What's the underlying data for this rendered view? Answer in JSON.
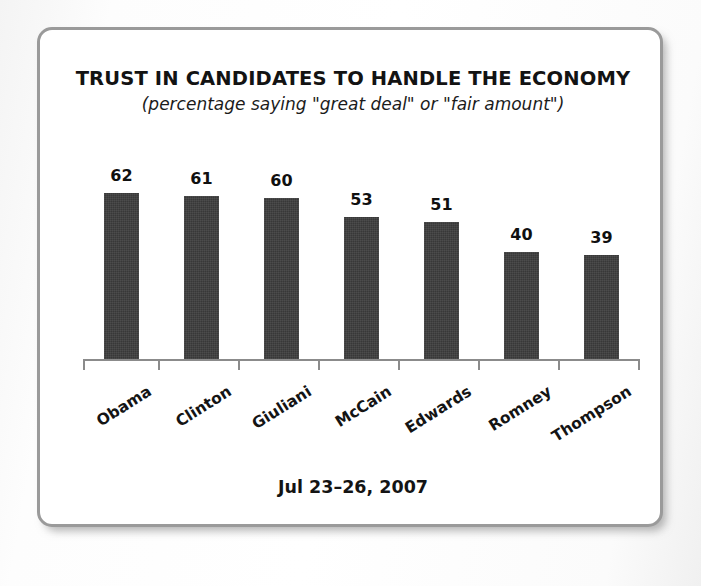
{
  "frame": {
    "border_color": "#9a9a9a",
    "background": "#ffffff"
  },
  "header": {
    "title": "TRUST IN CANDIDATES TO HANDLE THE ECONOMY",
    "subtitle": "(percentage saying \"great deal\" or \"fair amount\")"
  },
  "footer": {
    "date": "Jul 23–26, 2007"
  },
  "chart_data": {
    "type": "bar",
    "title": "TRUST IN CANDIDATES TO HANDLE THE ECONOMY",
    "subtitle": "(percentage saying \"great deal\" or \"fair amount\")",
    "xlabel": "",
    "ylabel": "",
    "ylim": [
      0,
      70
    ],
    "grid": false,
    "legend": "none",
    "bar_color": "#383838",
    "axis_color": "#8b8b8b",
    "value_label_position": "above",
    "xtick_label_rotation": -32,
    "categories": [
      "Obama",
      "Clinton",
      "Giuliani",
      "McCain",
      "Edwards",
      "Romney",
      "Thompson"
    ],
    "values": [
      62,
      61,
      60,
      53,
      51,
      40,
      39
    ],
    "points": [
      {
        "category": "Obama",
        "value": 62
      },
      {
        "category": "Clinton",
        "value": 61
      },
      {
        "category": "Giuliani",
        "value": 60
      },
      {
        "category": "McCain",
        "value": 53
      },
      {
        "category": "Edwards",
        "value": 51
      },
      {
        "category": "Romney",
        "value": 40
      },
      {
        "category": "Thompson",
        "value": 39
      }
    ]
  }
}
